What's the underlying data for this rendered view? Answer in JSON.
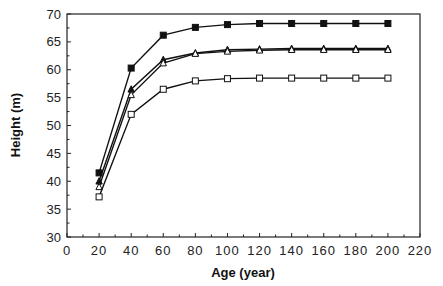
{
  "chart_data": {
    "type": "line",
    "title": "",
    "xlabel": "Age (year)",
    "ylabel": "Height (m)",
    "xlim": [
      0,
      220
    ],
    "ylim": [
      30,
      70
    ],
    "xticks": [
      0,
      20,
      40,
      60,
      80,
      100,
      120,
      140,
      160,
      180,
      200,
      220
    ],
    "yticks": [
      30,
      35,
      40,
      45,
      50,
      55,
      60,
      65,
      70
    ],
    "grid": false,
    "legend": null,
    "x": [
      20,
      40,
      60,
      80,
      100,
      120,
      140,
      160,
      180,
      200
    ],
    "series": [
      {
        "name": "Series 1 (filled square)",
        "marker": "filled-square",
        "values": [
          41.5,
          60.3,
          66.2,
          67.6,
          68.1,
          68.3,
          68.3,
          68.3,
          68.3,
          68.3
        ]
      },
      {
        "name": "Series 2 (filled triangle)",
        "marker": "filled-triangle",
        "values": [
          40.0,
          56.5,
          61.8,
          63.0,
          63.6,
          63.7,
          63.8,
          63.8,
          63.8,
          63.8
        ]
      },
      {
        "name": "Series 3 (open triangle)",
        "marker": "open-triangle",
        "values": [
          39.0,
          55.5,
          61.2,
          62.9,
          63.3,
          63.5,
          63.6,
          63.6,
          63.6,
          63.6
        ]
      },
      {
        "name": "Series 4 (open square)",
        "marker": "open-square",
        "values": [
          37.2,
          52.0,
          56.5,
          58.0,
          58.4,
          58.5,
          58.5,
          58.5,
          58.5,
          58.5
        ]
      }
    ]
  },
  "colors": {
    "line": "#111111",
    "axis": "#222222",
    "marker_fill": "#111111",
    "open_fill": "#ffffff"
  }
}
